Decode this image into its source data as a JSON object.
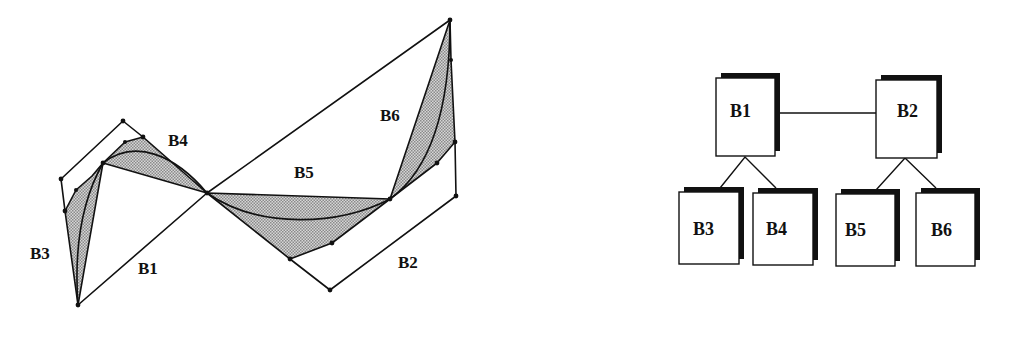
{
  "curve_diagram": {
    "labels": {
      "b1": "B1",
      "b2": "B2",
      "b3": "B3",
      "b4": "B4",
      "b5": "B5",
      "b6": "B6"
    }
  },
  "tree_diagram": {
    "root_left": "B1",
    "root_right": "B2",
    "children_left": [
      "B3",
      "B4"
    ],
    "children_right": [
      "B5",
      "B6"
    ]
  },
  "colors": {
    "line": "#111111",
    "shade": "#b8b8b8",
    "shadow": "#111111",
    "background": "#ffffff"
  }
}
